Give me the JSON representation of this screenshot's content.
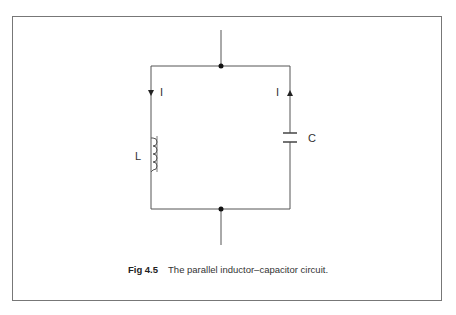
{
  "diagram": {
    "type": "circuit",
    "components": [
      {
        "id": "L",
        "kind": "inductor",
        "label": "L",
        "branch": "left"
      },
      {
        "id": "C",
        "kind": "capacitor",
        "label": "C",
        "branch": "right"
      }
    ],
    "current_labels": {
      "left": "I",
      "right": "I"
    },
    "nodes": [
      "top-junction",
      "bottom-junction"
    ]
  },
  "caption": {
    "fig_number": "Fig 4.5",
    "text": "The parallel inductor–capacitor circuit."
  }
}
